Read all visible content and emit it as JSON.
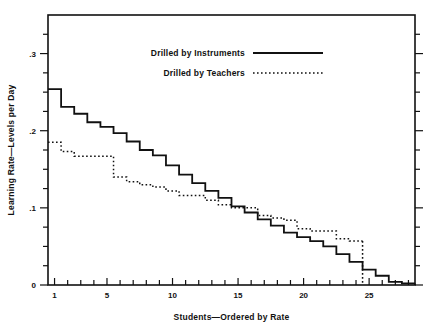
{
  "chart_data": {
    "type": "line",
    "subtype": "step",
    "title": "",
    "xlabel": "Students—Ordered by Rate",
    "ylabel": "Learning Rate—Levels per Day",
    "xlim": [
      0.5,
      28.5
    ],
    "ylim": [
      0,
      0.35
    ],
    "xticks": [
      1,
      2,
      3,
      4,
      5,
      6,
      7,
      8,
      9,
      10,
      11,
      12,
      13,
      14,
      15,
      16,
      17,
      18,
      19,
      20,
      21,
      22,
      23,
      24,
      25,
      26,
      27,
      28
    ],
    "xtick_labels": [
      "1",
      "",
      "",
      "",
      "5",
      "",
      "",
      "",
      "",
      "10",
      "",
      "",
      "",
      "",
      "15",
      "",
      "",
      "",
      "",
      "20",
      "",
      "",
      "",
      "",
      "25",
      "",
      "",
      ""
    ],
    "yticks": [
      0,
      0.025,
      0.05,
      0.075,
      0.1,
      0.125,
      0.15,
      0.175,
      0.2,
      0.225,
      0.25,
      0.275,
      0.3,
      0.325
    ],
    "ytick_labels": [
      "0",
      "",
      "",
      "",
      ".1",
      "",
      "",
      "",
      ".2",
      "",
      "",
      "",
      ".3",
      ""
    ],
    "ymajor": [
      0,
      0.1,
      0.2,
      0.3
    ],
    "grid": false,
    "legend_position": "top-center",
    "series": [
      {
        "name": "Drilled by Instruments",
        "style": "solid",
        "color": "#111111",
        "x": [
          1,
          2,
          3,
          4,
          5,
          6,
          7,
          8,
          9,
          10,
          11,
          12,
          13,
          14,
          15,
          16,
          17,
          18,
          19,
          20,
          21,
          22,
          23,
          24,
          25,
          26,
          27,
          28
        ],
        "values": [
          0.254,
          0.231,
          0.222,
          0.211,
          0.205,
          0.197,
          0.186,
          0.175,
          0.168,
          0.155,
          0.143,
          0.132,
          0.122,
          0.113,
          0.102,
          0.094,
          0.085,
          0.077,
          0.068,
          0.062,
          0.057,
          0.05,
          0.04,
          0.03,
          0.02,
          0.012,
          0.004,
          0.002
        ]
      },
      {
        "name": "Drilled by Teachers",
        "style": "dotted",
        "color": "#111111",
        "x": [
          1,
          2,
          3,
          4,
          5,
          6,
          7,
          8,
          9,
          10,
          11,
          12,
          13,
          14,
          15,
          16,
          17,
          18,
          19,
          20,
          21,
          22,
          23,
          24
        ],
        "values": [
          0.185,
          0.173,
          0.167,
          0.167,
          0.167,
          0.14,
          0.134,
          0.13,
          0.127,
          0.122,
          0.116,
          0.116,
          0.11,
          0.104,
          0.1,
          0.1,
          0.09,
          0.087,
          0.084,
          0.073,
          0.07,
          0.07,
          0.06,
          0.057
        ]
      }
    ]
  },
  "legend": {
    "items": [
      {
        "label": "Drilled by Instruments",
        "style": "solid"
      },
      {
        "label": "Drilled by Teachers",
        "style": "dotted"
      }
    ]
  },
  "axes": {
    "x_title": "Students—Ordered by Rate",
    "y_title": "Learning Rate—Levels per Day"
  }
}
